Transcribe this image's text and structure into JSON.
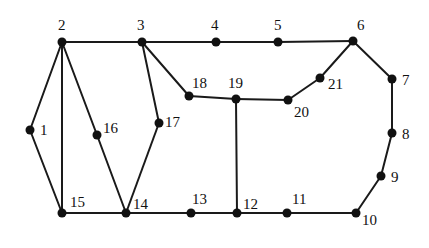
{
  "diagram": {
    "type": "undirected-graph",
    "node_color": "#111111",
    "edge_color": "#1a1a1a",
    "nodes": [
      {
        "id": "1",
        "label": "1",
        "x": 30,
        "y": 130,
        "lx": 40,
        "ly": 135
      },
      {
        "id": "2",
        "label": "2",
        "x": 62,
        "y": 42,
        "lx": 58,
        "ly": 30
      },
      {
        "id": "3",
        "label": "3",
        "x": 142,
        "y": 42,
        "lx": 137,
        "ly": 30
      },
      {
        "id": "4",
        "label": "4",
        "x": 216,
        "y": 42,
        "lx": 211,
        "ly": 30
      },
      {
        "id": "5",
        "label": "5",
        "x": 278,
        "y": 42,
        "lx": 274,
        "ly": 30
      },
      {
        "id": "6",
        "label": "6",
        "x": 353,
        "y": 41,
        "lx": 357,
        "ly": 30
      },
      {
        "id": "7",
        "label": "7",
        "x": 392,
        "y": 79,
        "lx": 402,
        "ly": 85
      },
      {
        "id": "8",
        "label": "8",
        "x": 392,
        "y": 133,
        "lx": 402,
        "ly": 139
      },
      {
        "id": "9",
        "label": "9",
        "x": 381,
        "y": 176,
        "lx": 391,
        "ly": 182
      },
      {
        "id": "10",
        "label": "10",
        "x": 356,
        "y": 213,
        "lx": 362,
        "ly": 225
      },
      {
        "id": "11",
        "label": "11",
        "x": 287,
        "y": 213,
        "lx": 292,
        "ly": 204
      },
      {
        "id": "12",
        "label": "12",
        "x": 237,
        "y": 213,
        "lx": 243,
        "ly": 209
      },
      {
        "id": "13",
        "label": "13",
        "x": 191,
        "y": 213,
        "lx": 192,
        "ly": 204
      },
      {
        "id": "14",
        "label": "14",
        "x": 126,
        "y": 213,
        "lx": 133,
        "ly": 209
      },
      {
        "id": "15",
        "label": "15",
        "x": 62,
        "y": 213,
        "lx": 70,
        "ly": 207
      },
      {
        "id": "16",
        "label": "16",
        "x": 97,
        "y": 135,
        "lx": 103,
        "ly": 133
      },
      {
        "id": "17",
        "label": "17",
        "x": 159,
        "y": 123,
        "lx": 165,
        "ly": 127
      },
      {
        "id": "18",
        "label": "18",
        "x": 189,
        "y": 96,
        "lx": 192,
        "ly": 88
      },
      {
        "id": "19",
        "label": "19",
        "x": 236,
        "y": 99,
        "lx": 228,
        "ly": 88
      },
      {
        "id": "20",
        "label": "20",
        "x": 288,
        "y": 100,
        "lx": 294,
        "ly": 117
      },
      {
        "id": "21",
        "label": "21",
        "x": 320,
        "y": 78,
        "lx": 328,
        "ly": 89
      }
    ],
    "edges": [
      [
        "2",
        "3"
      ],
      [
        "3",
        "4"
      ],
      [
        "4",
        "5"
      ],
      [
        "5",
        "6"
      ],
      [
        "6",
        "7"
      ],
      [
        "7",
        "8"
      ],
      [
        "8",
        "9"
      ],
      [
        "9",
        "10"
      ],
      [
        "10",
        "11"
      ],
      [
        "11",
        "12"
      ],
      [
        "12",
        "13"
      ],
      [
        "13",
        "14"
      ],
      [
        "14",
        "15"
      ],
      [
        "2",
        "1"
      ],
      [
        "1",
        "15"
      ],
      [
        "2",
        "15"
      ],
      [
        "2",
        "16"
      ],
      [
        "16",
        "14"
      ],
      [
        "3",
        "17"
      ],
      [
        "17",
        "14"
      ],
      [
        "3",
        "18"
      ],
      [
        "18",
        "19"
      ],
      [
        "19",
        "20"
      ],
      [
        "20",
        "21"
      ],
      [
        "21",
        "6"
      ],
      [
        "19",
        "12"
      ]
    ]
  }
}
